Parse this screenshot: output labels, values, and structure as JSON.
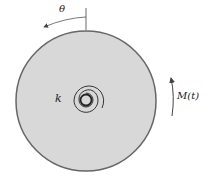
{
  "diagram": {
    "angle_label": "θ",
    "stiffness_label": "k",
    "moment_label": "M(t)",
    "colors": {
      "disk_fill": "#d8d8d8",
      "disk_stroke": "#666666",
      "line": "#333333"
    }
  }
}
